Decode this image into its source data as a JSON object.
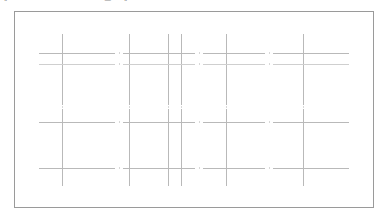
{
  "toolbar": {
    "visible_fragments": [
      "‖",
      "══",
      "⋯",
      "∙",
      "▭",
      "‖"
    ],
    "note_cropped": "toolbar row cropped at top edge"
  },
  "canvas": {
    "label": "line-drawing-canvas",
    "border_color": "#9a9a9a",
    "background_color": "#ffffff",
    "line_color": "#b9b9b9",
    "accent_line_color": "#9d9d9d",
    "faint_line_color": "#dedede",
    "x": 14,
    "y": 11,
    "width": 360,
    "height": 197
  },
  "chart_data": {
    "type": "line",
    "title": "",
    "xlabel": "",
    "ylabel": "",
    "grid": true,
    "legend": "none",
    "xlim": [
      0,
      358
    ],
    "ylim": [
      0,
      195
    ],
    "vertical_lines": [
      {
        "id": "v1",
        "x": 47,
        "y1": 22,
        "y2": 93,
        "weight": "normal"
      },
      {
        "id": "v2",
        "x": 114,
        "y1": 22,
        "y2": 93,
        "weight": "normal"
      },
      {
        "id": "v3",
        "x": 153,
        "y1": 22,
        "y2": 93,
        "weight": "normal"
      },
      {
        "id": "v4",
        "x": 166,
        "y1": 22,
        "y2": 93,
        "weight": "normal"
      },
      {
        "id": "v5",
        "x": 211,
        "y1": 22,
        "y2": 93,
        "weight": "normal"
      },
      {
        "id": "v6",
        "x": 288,
        "y1": 22,
        "y2": 93,
        "weight": "normal"
      },
      {
        "id": "v7",
        "x": 47,
        "y1": 97,
        "y2": 174,
        "weight": "normal"
      },
      {
        "id": "v8",
        "x": 114,
        "y1": 97,
        "y2": 174,
        "weight": "normal"
      },
      {
        "id": "v9",
        "x": 153,
        "y1": 97,
        "y2": 174,
        "weight": "normal"
      },
      {
        "id": "v10",
        "x": 166,
        "y1": 97,
        "y2": 174,
        "weight": "normal"
      },
      {
        "id": "v11",
        "x": 211,
        "y1": 97,
        "y2": 174,
        "weight": "normal"
      },
      {
        "id": "v12",
        "x": 288,
        "y1": 97,
        "y2": 174,
        "weight": "normal"
      }
    ],
    "horizontal_lines": [
      {
        "id": "h1",
        "y": 41,
        "x1": 24,
        "x2": 100,
        "weight": "normal"
      },
      {
        "id": "h2",
        "y": 52,
        "x1": 24,
        "x2": 100,
        "weight": "pale"
      },
      {
        "id": "h3",
        "y": 41,
        "x1": 108,
        "x2": 180,
        "weight": "normal"
      },
      {
        "id": "h4",
        "y": 52,
        "x1": 108,
        "x2": 180,
        "weight": "pale"
      },
      {
        "id": "h5",
        "y": 41,
        "x1": 188,
        "x2": 250,
        "weight": "normal"
      },
      {
        "id": "h6",
        "y": 52,
        "x1": 188,
        "x2": 250,
        "weight": "pale"
      },
      {
        "id": "h7",
        "y": 41,
        "x1": 258,
        "x2": 334,
        "weight": "normal"
      },
      {
        "id": "h8",
        "y": 52,
        "x1": 258,
        "x2": 334,
        "weight": "pale"
      },
      {
        "id": "h9",
        "y": 110,
        "x1": 24,
        "x2": 100,
        "weight": "normal"
      },
      {
        "id": "h10",
        "y": 110,
        "x1": 108,
        "x2": 180,
        "weight": "normal"
      },
      {
        "id": "h11",
        "y": 110,
        "x1": 188,
        "x2": 250,
        "weight": "normal"
      },
      {
        "id": "h12",
        "y": 110,
        "x1": 258,
        "x2": 334,
        "weight": "normal"
      },
      {
        "id": "h13",
        "y": 156,
        "x1": 24,
        "x2": 100,
        "weight": "normal"
      },
      {
        "id": "h14",
        "y": 156,
        "x1": 108,
        "x2": 180,
        "weight": "normal"
      },
      {
        "id": "h15",
        "y": 156,
        "x1": 188,
        "x2": 250,
        "weight": "normal"
      },
      {
        "id": "h16",
        "y": 156,
        "x1": 258,
        "x2": 334,
        "weight": "normal"
      }
    ],
    "tick_marks": [
      {
        "x": 104,
        "y": 41
      },
      {
        "x": 104,
        "y": 52
      },
      {
        "x": 184,
        "y": 41
      },
      {
        "x": 184,
        "y": 52
      },
      {
        "x": 254,
        "y": 41
      },
      {
        "x": 254,
        "y": 52
      },
      {
        "x": 104,
        "y": 110
      },
      {
        "x": 184,
        "y": 110
      },
      {
        "x": 254,
        "y": 110
      },
      {
        "x": 104,
        "y": 156
      },
      {
        "x": 184,
        "y": 156
      },
      {
        "x": 254,
        "y": 156
      },
      {
        "x": 47,
        "y": 95
      },
      {
        "x": 114,
        "y": 95
      },
      {
        "x": 153,
        "y": 95
      },
      {
        "x": 166,
        "y": 95
      },
      {
        "x": 211,
        "y": 95
      },
      {
        "x": 288,
        "y": 95
      }
    ]
  }
}
